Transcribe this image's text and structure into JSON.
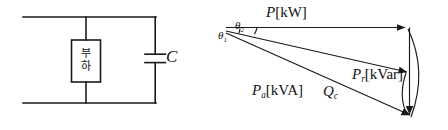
{
  "figure": {
    "circuit": {
      "load_box_label": "부하",
      "load_box_line1": "부",
      "load_box_line2": "하",
      "capacitor_label": "C"
    },
    "phasor": {
      "real_power_label": "P",
      "real_power_unit": "[kW]",
      "reactive_power_label": "P",
      "reactive_power_sub": "r",
      "reactive_power_unit": "[kVar]",
      "apparent_power_label": "P",
      "apparent_power_sub": "a",
      "apparent_power_unit": "[kVA]",
      "capacitive_reactive_label": "Q",
      "capacitive_reactive_sub": "c",
      "angle1_label": "θ",
      "angle1_sub": "1",
      "angle2_label": "θ",
      "angle2_sub": "2"
    },
    "colors": {
      "stroke": "#1a1a1a",
      "text": "#111111",
      "background": "#ffffff"
    }
  }
}
